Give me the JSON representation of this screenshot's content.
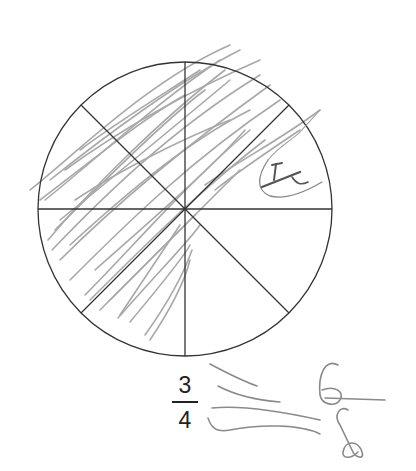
{
  "worksheet": {
    "circle": {
      "cx": 185,
      "cy": 209,
      "r": 147,
      "segments": 8,
      "shaded_segments": 6,
      "stroke_color": "#333333"
    },
    "printed_fraction": {
      "numerator": "3",
      "denominator": "4"
    },
    "handwritten": {
      "equals_sign": "=",
      "fraction": {
        "numerator": "6",
        "denominator": "8"
      },
      "segment_label": "H",
      "pencil_color": "#8a8a8a"
    }
  }
}
